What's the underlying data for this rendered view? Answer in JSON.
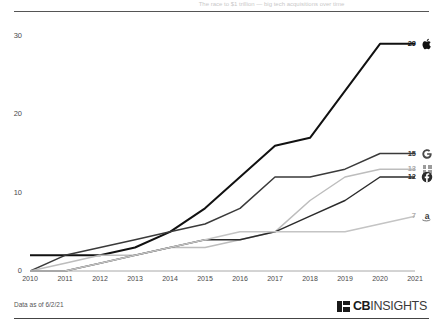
{
  "title_strip": "The race to $1 trillion — big tech acquisitions over time",
  "footer": {
    "note": "Data as of 6/2/21",
    "brand_bold": "CB",
    "brand_light": "INSIGHTS",
    "brand_mark": "cb-insights-mark-icon"
  },
  "axis": {
    "y_ticks": [
      "30",
      "20",
      "10",
      "0"
    ],
    "x_ticks": [
      "2010",
      "2011",
      "2012",
      "2013",
      "2014",
      "2015",
      "2016",
      "2017",
      "2018",
      "2019",
      "2020",
      "2021"
    ]
  },
  "end_labels": [
    {
      "value": "29",
      "logo": "apple-logo-icon",
      "color": "#111111"
    },
    {
      "value": "15",
      "logo": "google-logo-icon",
      "color": "#3a3a3a"
    },
    {
      "value": "13",
      "logo": "microsoft-logo-icon",
      "color": "#aaaaaa"
    },
    {
      "value": "12",
      "logo": "facebook-logo-icon",
      "color": "#2b2b2b"
    },
    {
      "value": "7",
      "logo": "amazon-logo-icon",
      "color": "#b0b0b0"
    }
  ],
  "chart_data": {
    "type": "line",
    "title": "The race to $1 trillion — big tech acquisitions over time",
    "xlabel": "",
    "ylabel": "",
    "x": [
      2010,
      2011,
      2012,
      2013,
      2014,
      2015,
      2016,
      2017,
      2018,
      2019,
      2020,
      2021
    ],
    "ylim": [
      0,
      32
    ],
    "xlim": [
      2010,
      2021
    ],
    "yticks": [
      0,
      10,
      20,
      30
    ],
    "grid": false,
    "legend": "right-endpoint-labels",
    "series": [
      {
        "name": "Apple",
        "logo": "apple-logo-icon",
        "color": "#111111",
        "end_value": 29,
        "values": [
          2,
          2,
          2,
          3,
          5,
          8,
          12,
          16,
          17,
          23,
          29,
          29
        ]
      },
      {
        "name": "Google",
        "logo": "google-logo-icon",
        "color": "#3a3a3a",
        "end_value": 15,
        "values": [
          0,
          2,
          3,
          4,
          5,
          6,
          8,
          12,
          12,
          13,
          15,
          15
        ]
      },
      {
        "name": "Microsoft",
        "logo": "microsoft-logo-icon",
        "color": "#bdbdbd",
        "end_value": 13,
        "values": [
          0,
          1,
          2,
          2,
          3,
          3,
          4,
          5,
          9,
          12,
          13,
          13
        ]
      },
      {
        "name": "Facebook",
        "logo": "facebook-logo-icon",
        "color": "#2b2b2b",
        "end_value": 12,
        "values": [
          0,
          0,
          1,
          2,
          3,
          4,
          4,
          5,
          7,
          9,
          12,
          12
        ]
      },
      {
        "name": "Amazon",
        "logo": "amazon-logo-icon",
        "color": "#c4c4c4",
        "end_value": 7,
        "values": [
          0,
          0,
          1,
          2,
          3,
          4,
          5,
          5,
          5,
          5,
          6,
          7
        ]
      }
    ]
  }
}
